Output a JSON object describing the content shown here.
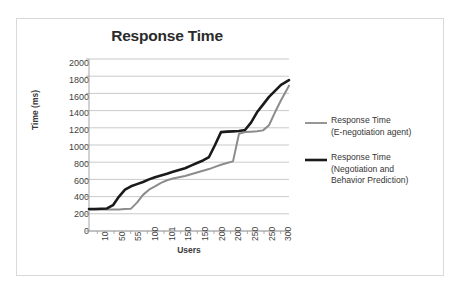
{
  "chart_data": {
    "type": "line",
    "title": "Response Time",
    "xlabel": "Users",
    "ylabel": "Time (ms)",
    "ylim": [
      0,
      2000
    ],
    "ytick_step": 200,
    "yticks": [
      2000,
      1800,
      1600,
      1400,
      1200,
      1000,
      800,
      600,
      400,
      200,
      0
    ],
    "categories": [
      "10",
      "50",
      "55",
      "100",
      "101",
      "150",
      "150",
      "200",
      "200",
      "250",
      "250",
      "300"
    ],
    "grid": "horizontal",
    "legend_position": "right",
    "series": [
      {
        "name": "Response Time (E-negotiation agent)",
        "name_line1": "Response Time",
        "name_line2": "(E-negotiation agent)",
        "color": "#8c8c8c",
        "width": 2,
        "x": [
          0,
          3,
          6,
          9,
          12,
          15,
          18,
          21,
          24,
          27,
          30,
          33,
          36,
          39,
          42,
          45,
          48,
          51,
          54,
          57,
          60,
          63,
          66,
          69,
          72,
          75,
          78,
          81,
          84,
          87,
          90,
          93,
          96,
          100
        ],
        "values": [
          250,
          250,
          250,
          250,
          250,
          250,
          255,
          260,
          330,
          420,
          480,
          520,
          560,
          590,
          610,
          625,
          640,
          660,
          680,
          700,
          720,
          745,
          770,
          790,
          810,
          1130,
          1150,
          1155,
          1160,
          1170,
          1230,
          1380,
          1520,
          1690
        ]
      },
      {
        "name": "Response Time (Negotiation and Behavior Prediction)",
        "name_line1": "Response Time",
        "name_line2": "(Negotiation and",
        "name_line3": "Behavior Prediction)",
        "color": "#1a1a1a",
        "width": 2.6,
        "x": [
          0,
          3,
          6,
          9,
          12,
          15,
          18,
          21,
          24,
          27,
          30,
          33,
          36,
          39,
          42,
          45,
          48,
          51,
          54,
          57,
          60,
          63,
          66,
          69,
          72,
          75,
          78,
          81,
          84,
          87,
          90,
          93,
          96,
          100
        ],
        "values": [
          255,
          255,
          258,
          262,
          300,
          400,
          480,
          520,
          545,
          570,
          600,
          625,
          645,
          665,
          690,
          710,
          730,
          760,
          790,
          820,
          860,
          1000,
          1150,
          1155,
          1158,
          1162,
          1175,
          1260,
          1380,
          1470,
          1560,
          1630,
          1700,
          1755
        ]
      }
    ]
  }
}
